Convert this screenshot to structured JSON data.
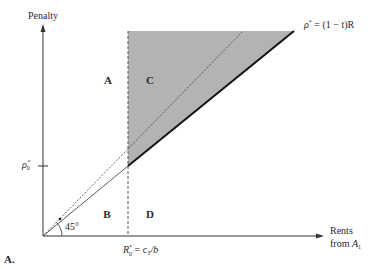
{
  "figure": {
    "panel_label": "A.",
    "y_axis_label": "Penalty",
    "x_axis_label_line1": "Rents",
    "x_axis_label_line2_prefix": "from ",
    "x_axis_label_line2_var": "A",
    "x_axis_label_line2_sub": "1",
    "line_label": {
      "lhs": "ρ",
      "lhs_sup": "*",
      "rhs": " = (1 − t)R"
    },
    "y_tick_label": {
      "main": "ρ̂",
      "sub": "0"
    },
    "x_tick_label": {
      "main": "R",
      "sup": "*",
      "sub": "0",
      "rhs": " = c",
      "rhs_sub": "T",
      "rhs_tail": "/b"
    },
    "angle_label": "45°",
    "regions": {
      "a": "A",
      "b": "B",
      "c": "C",
      "d": "D"
    },
    "colors": {
      "shaded_region": "#b3b3b3",
      "axis": "#333333",
      "solid_line": "#1a1a1a",
      "background": "#ffffff"
    }
  }
}
